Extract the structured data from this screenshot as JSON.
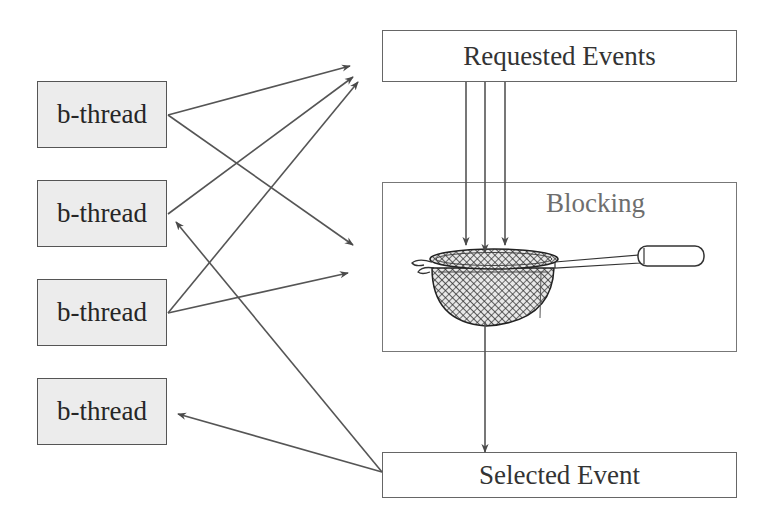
{
  "diagram": {
    "type": "behavioral-programming-flow",
    "bthreads": [
      {
        "label": "b-thread"
      },
      {
        "label": "b-thread"
      },
      {
        "label": "b-thread"
      },
      {
        "label": "b-thread"
      }
    ],
    "requested_events": {
      "label": "Requested Events"
    },
    "blocking": {
      "label": "Blocking",
      "icon": "strainer-icon"
    },
    "selected_event": {
      "label": "Selected Event"
    },
    "edges": [
      {
        "from": "b-thread-1",
        "to": "requested-events"
      },
      {
        "from": "b-thread-1",
        "to": "blocking"
      },
      {
        "from": "b-thread-2",
        "to": "requested-events"
      },
      {
        "from": "b-thread-3",
        "to": "requested-events"
      },
      {
        "from": "b-thread-3",
        "to": "blocking"
      },
      {
        "from": "requested-events",
        "to": "blocking",
        "count": 3
      },
      {
        "from": "blocking",
        "to": "selected-event"
      },
      {
        "from": "selected-event",
        "to": "b-thread-2"
      },
      {
        "from": "selected-event",
        "to": "b-thread-4"
      }
    ],
    "colors": {
      "bthread_fill": "#ececec",
      "border": "#555555",
      "arrow": "#555555",
      "blocking_text": "#6e6e6e"
    }
  }
}
